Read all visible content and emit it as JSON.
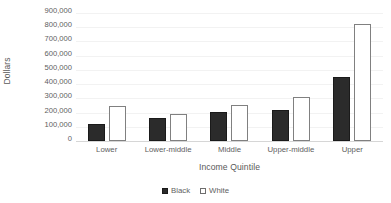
{
  "chart_data": {
    "type": "bar",
    "title": "",
    "xlabel": "Income Quintile",
    "ylabel": "Dollars",
    "categories": [
      "Lower",
      "Lower-middle",
      "Middle",
      "Upper-middle",
      "Upper"
    ],
    "series": [
      {
        "name": "Black",
        "color": "#2b2b2b",
        "values": [
          120000,
          160000,
          205000,
          220000,
          450000
        ]
      },
      {
        "name": "White",
        "color": "#ffffff",
        "values": [
          245000,
          190000,
          250000,
          310000,
          820000
        ]
      }
    ],
    "ylim": [
      0,
      900000
    ],
    "ytick_step": 100000,
    "ytick_labels": [
      "900,000",
      "800,000",
      "700,000",
      "600,000",
      "500,000",
      "400,000",
      "300,000",
      "200,000",
      "100,000",
      "0"
    ],
    "ytick_values": [
      900000,
      800000,
      700000,
      600000,
      500000,
      400000,
      300000,
      200000,
      100000,
      0
    ],
    "grid": true,
    "grid_axis": "y",
    "legend_position": "bottom",
    "legend": [
      {
        "label": "Black",
        "swatch": "filled-square"
      },
      {
        "label": "White",
        "swatch": "outlined-square"
      }
    ]
  }
}
